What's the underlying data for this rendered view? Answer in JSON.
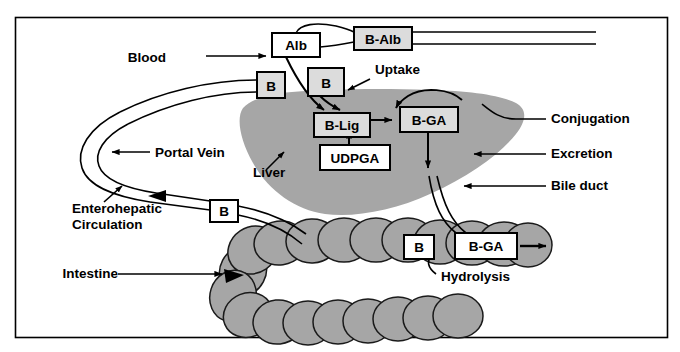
{
  "figure": {
    "frame_color": "#000000",
    "background_color": "#ffffff"
  },
  "colors": {
    "organ_fill": "#a6a6a6",
    "organ_stroke": "#000000",
    "box_fill_gray": "#dcdcdc",
    "box_fill_white": "#ffffff",
    "box_stroke": "#000000",
    "line": "#000000",
    "text": "#000000"
  },
  "boxes": [
    {
      "id": "alb",
      "label": "Alb",
      "fill": "white",
      "x": 272,
      "y": 33,
      "w": 48,
      "h": 24
    },
    {
      "id": "balb",
      "label": "B-Alb",
      "fill": "gray",
      "x": 354,
      "y": 27,
      "w": 58,
      "h": 23
    },
    {
      "id": "b1",
      "label": "B",
      "fill": "gray",
      "x": 257,
      "y": 72,
      "w": 28,
      "h": 26
    },
    {
      "id": "b2",
      "label": "B",
      "fill": "gray",
      "x": 308,
      "y": 68,
      "w": 36,
      "h": 28
    },
    {
      "id": "blig",
      "label": "B-Lig",
      "fill": "gray",
      "x": 314,
      "y": 113,
      "w": 56,
      "h": 24
    },
    {
      "id": "bga1",
      "label": "B-GA",
      "fill": "gray",
      "x": 400,
      "y": 107,
      "w": 58,
      "h": 25
    },
    {
      "id": "udpga",
      "label": "UDPGA",
      "fill": "white",
      "x": 320,
      "y": 145,
      "w": 70,
      "h": 25
    },
    {
      "id": "b3",
      "label": "B",
      "fill": "white",
      "x": 210,
      "y": 200,
      "w": 28,
      "h": 22
    },
    {
      "id": "b4",
      "label": "B",
      "fill": "white",
      "x": 404,
      "y": 235,
      "w": 30,
      "h": 24
    },
    {
      "id": "bga2",
      "label": "B-GA",
      "fill": "white",
      "x": 455,
      "y": 233,
      "w": 62,
      "h": 26
    }
  ],
  "labels": [
    {
      "id": "blood",
      "text": "Blood",
      "x": 166,
      "y": 62
    },
    {
      "id": "uptake",
      "text": "Uptake",
      "x": 375,
      "y": 74
    },
    {
      "id": "conjugation",
      "text": "Conjugation",
      "x": 551,
      "y": 123
    },
    {
      "id": "excretion",
      "text": "Excretion",
      "x": 551,
      "y": 158
    },
    {
      "id": "bile-duct",
      "text": "Bile duct",
      "x": 551,
      "y": 190
    },
    {
      "id": "portal-vein",
      "text": "Portal Vein",
      "x": 155,
      "y": 157
    },
    {
      "id": "liver",
      "text": "Liver",
      "x": 253,
      "y": 177
    },
    {
      "id": "intestine",
      "text": "Intestine",
      "x": 62,
      "y": 278
    },
    {
      "id": "hydrolysis",
      "text": "Hydrolysis",
      "x": 441,
      "y": 281
    }
  ],
  "multiline_labels": [
    {
      "id": "enterohepatic-circulation",
      "line1": "Enterohepatic",
      "line2": "Circulation",
      "x": 72,
      "y": 213
    }
  ],
  "organs": [
    {
      "id": "liver-shape",
      "name": "liver"
    },
    {
      "id": "intestine-shape",
      "name": "intestine"
    }
  ],
  "vessels": [
    {
      "id": "blood-vessel",
      "name": "blood-vessel"
    },
    {
      "id": "portal-vein-vessel",
      "name": "portal-vein"
    },
    {
      "id": "bile-duct-vessel",
      "name": "bile-duct"
    }
  ]
}
